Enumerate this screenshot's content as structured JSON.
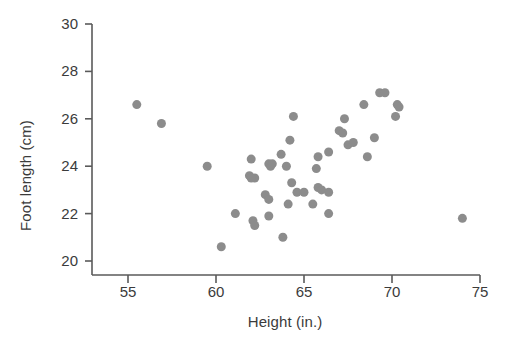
{
  "chart_data": {
    "type": "scatter",
    "title": "",
    "xlabel": "Height (in.)",
    "ylabel": "Foot length (cm)",
    "xlim": [
      52.9,
      75.0
    ],
    "ylim": [
      19.3,
      30.0
    ],
    "xticks": [
      55,
      60,
      65,
      70,
      75
    ],
    "yticks": [
      20,
      22,
      24,
      26,
      28,
      30
    ],
    "grid": false,
    "legend": null,
    "marker": {
      "shape": "circle",
      "color": "#8c8c8c",
      "size_px": 9
    },
    "axis_color": "#5a5a5a",
    "background": "#ffffff",
    "n_points": 48,
    "points": [
      [
        55.5,
        26.6
      ],
      [
        56.9,
        25.8
      ],
      [
        59.5,
        24.0
      ],
      [
        61.1,
        22.0
      ],
      [
        62.0,
        24.3
      ],
      [
        61.9,
        23.6
      ],
      [
        62.2,
        23.5
      ],
      [
        62.1,
        21.7
      ],
      [
        62.2,
        21.5
      ],
      [
        60.3,
        20.6
      ],
      [
        63.0,
        24.1
      ],
      [
        63.1,
        24.0
      ],
      [
        62.8,
        22.8
      ],
      [
        63.0,
        22.6
      ],
      [
        63.0,
        21.9
      ],
      [
        63.7,
        24.5
      ],
      [
        64.0,
        24.0
      ],
      [
        63.8,
        21.0
      ],
      [
        64.4,
        26.1
      ],
      [
        64.2,
        25.1
      ],
      [
        64.3,
        23.3
      ],
      [
        64.6,
        22.9
      ],
      [
        64.1,
        22.4
      ],
      [
        65.5,
        22.4
      ],
      [
        65.8,
        24.4
      ],
      [
        65.7,
        23.9
      ],
      [
        65.8,
        23.1
      ],
      [
        66.4,
        24.6
      ],
      [
        66.4,
        22.9
      ],
      [
        66.4,
        22.0
      ],
      [
        67.0,
        25.5
      ],
      [
        67.2,
        25.4
      ],
      [
        67.3,
        26.0
      ],
      [
        67.5,
        24.9
      ],
      [
        68.4,
        26.6
      ],
      [
        68.6,
        24.4
      ],
      [
        69.0,
        25.2
      ],
      [
        69.3,
        27.1
      ],
      [
        69.6,
        27.1
      ],
      [
        70.3,
        26.6
      ],
      [
        70.2,
        26.1
      ],
      [
        70.4,
        26.5
      ],
      [
        74.0,
        21.8
      ],
      [
        62.0,
        23.5
      ],
      [
        63.2,
        24.1
      ],
      [
        66.0,
        23.0
      ],
      [
        65.0,
        22.9
      ],
      [
        67.8,
        25.0
      ]
    ]
  }
}
